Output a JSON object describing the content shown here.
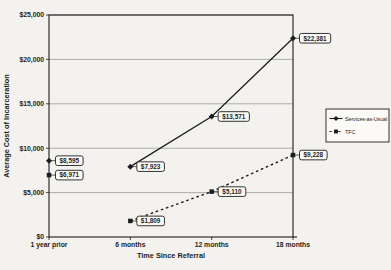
{
  "chart_data": {
    "type": "line",
    "title": "",
    "xlabel": "Time Since Referral",
    "ylabel": "Average Cost of Incarceration",
    "categories": [
      "1 year prior",
      "6 months",
      "12 months",
      "18 months"
    ],
    "ylim": [
      0,
      25000
    ],
    "y_tick_values": [
      0,
      5000,
      10000,
      15000,
      20000,
      25000
    ],
    "y_tick_labels": [
      "$0",
      "$5,000",
      "$10,000",
      "$15,000",
      "$20,000",
      "$25,000"
    ],
    "grid": "horizontal",
    "legend_position": "right",
    "series": [
      {
        "name": "Services-as-Usual",
        "marker": "diamond",
        "line_style": "solid",
        "line_from_index": 1,
        "values": [
          8595,
          7923,
          13571,
          22381
        ],
        "labels": [
          "$8,595",
          "$7,923",
          "$13,571",
          "$22,381"
        ]
      },
      {
        "name": "TFC",
        "marker": "square",
        "line_style": "dashed",
        "line_from_index": 1,
        "values": [
          6971,
          1809,
          5110,
          9228
        ],
        "labels": [
          "$6,971",
          "$1,809",
          "$5,110",
          "$9,228"
        ]
      }
    ],
    "colors": {
      "ink": "#1d1d1d",
      "grid": "#8f8f8f",
      "label_box_bg": "#fbfaf7",
      "page_bg": "#f3f2ef"
    }
  }
}
